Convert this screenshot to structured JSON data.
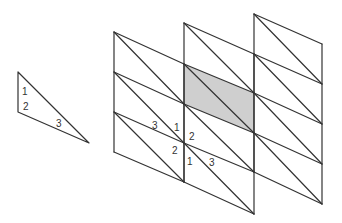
{
  "figure": {
    "colors": {
      "line": "#333333",
      "shade": "#cfcfcf",
      "background": "#ffffff"
    }
  },
  "small_triangle": {
    "vertices": [
      [
        18,
        72
      ],
      [
        18,
        112
      ],
      [
        89,
        143
      ]
    ],
    "labels": [
      {
        "text": "1",
        "x": 22,
        "y": 95
      },
      {
        "text": "2",
        "x": 23,
        "y": 110
      },
      {
        "text": "3",
        "x": 56,
        "y": 127
      }
    ]
  },
  "panels": [
    {
      "x_left": 114,
      "x_right": 184,
      "left_nodes": [
        32,
        72,
        112,
        152
      ],
      "right_nodes": [
        64,
        104,
        143,
        182
      ]
    },
    {
      "x_left": 184,
      "x_right": 254,
      "left_nodes": [
        23,
        64,
        104,
        143,
        182
      ],
      "right_nodes": [
        54,
        93,
        133,
        172,
        214
      ]
    },
    {
      "x_left": 254,
      "x_right": 322,
      "left_nodes": [
        14,
        54,
        93,
        133,
        172
      ],
      "right_nodes": [
        44,
        84,
        124,
        164,
        204
      ]
    }
  ],
  "shaded_cell": {
    "points": [
      [
        184,
        64
      ],
      [
        254,
        93
      ],
      [
        254,
        133
      ],
      [
        184,
        104
      ]
    ]
  },
  "vertex_labels": [
    {
      "text": "3",
      "x": 152,
      "y": 129
    },
    {
      "text": "1",
      "x": 174,
      "y": 131
    },
    {
      "text": "2",
      "x": 189,
      "y": 140
    },
    {
      "text": "2",
      "x": 172,
      "y": 154
    },
    {
      "text": "1",
      "x": 187,
      "y": 165
    },
    {
      "text": "3",
      "x": 209,
      "y": 166
    }
  ]
}
